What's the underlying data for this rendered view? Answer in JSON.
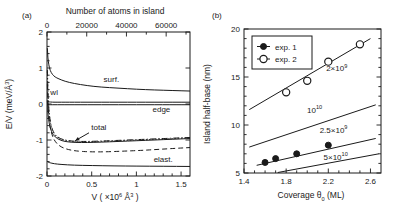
{
  "figure": {
    "panel_a_tag": "(a)",
    "panel_b_tag": "(b)"
  },
  "chart_data": [
    {
      "type": "line",
      "panel": "(a)",
      "title": "",
      "xlabel": "V ( ×10⁶ Å³ )",
      "xlabel_parts": {
        "base": "V ( ×10",
        "exp": "6",
        "unit": " Å",
        "unit_exp": "3",
        "close": " )"
      },
      "ylabel": "E/V (meV/Å³)",
      "ylabel_parts": {
        "base": "E/V (meV/Å",
        "exp": "3",
        "close": ")"
      },
      "top_axis_label": "Number of atoms in island",
      "xlim": [
        0,
        1.6
      ],
      "ylim": [
        -2,
        2
      ],
      "xticks": [
        0,
        0.5,
        1,
        1.5
      ],
      "xticklabels": [
        "0",
        "0.5",
        "1",
        "1.5"
      ],
      "yticks": [
        -2,
        -1,
        0,
        1,
        2
      ],
      "yticklabels": [
        "-2",
        "-1",
        "0",
        "1",
        "2"
      ],
      "top_ticks": [
        0,
        20000,
        40000,
        60000
      ],
      "top_ticklabels": [
        "0",
        "20000",
        "40000",
        "60000"
      ],
      "top_lim": [
        0,
        72000
      ],
      "grid": false,
      "legend": "inline-curve-labels",
      "annotations": [
        {
          "text": "surf.",
          "x": 0.72,
          "y": 0.62
        },
        {
          "text": "wl",
          "x": 0.08,
          "y": 0.25
        },
        {
          "text": "edge",
          "x": 1.28,
          "y": -0.22
        },
        {
          "text": "total",
          "x": 0.58,
          "y": -0.72
        },
        {
          "text": "elast.",
          "x": 1.3,
          "y": -1.62
        }
      ],
      "series": [
        {
          "name": "surf.",
          "style": "solid",
          "x": [
            0.004,
            0.01,
            0.02,
            0.035,
            0.06,
            0.09,
            0.13,
            0.2,
            0.3,
            0.45,
            0.6,
            0.8,
            1.0,
            1.2,
            1.4,
            1.6
          ],
          "y": [
            1.55,
            1.3,
            1.08,
            0.93,
            0.82,
            0.75,
            0.7,
            0.63,
            0.57,
            0.51,
            0.47,
            0.44,
            0.41,
            0.39,
            0.375,
            0.36
          ]
        },
        {
          "name": "wl",
          "style": "solid",
          "x": [
            0.004,
            0.02,
            0.06,
            0.12,
            0.2,
            0.3,
            0.45,
            0.6,
            0.8,
            1.0,
            1.2,
            1.4,
            1.6
          ],
          "y": [
            0.07,
            0.06,
            0.05,
            0.05,
            0.05,
            0.05,
            0.05,
            0.05,
            0.05,
            0.05,
            0.05,
            0.05,
            0.05
          ]
        },
        {
          "name": "edge",
          "style": "solid",
          "x": [
            0.004,
            0.03,
            0.1,
            0.3,
            0.6,
            1.0,
            1.4,
            1.6
          ],
          "y": [
            -0.02,
            -0.02,
            -0.02,
            -0.02,
            -0.02,
            -0.02,
            -0.02,
            -0.02
          ]
        },
        {
          "name": "total",
          "style": "solid",
          "x": [
            0.004,
            0.012,
            0.025,
            0.05,
            0.09,
            0.15,
            0.22,
            0.32,
            0.45,
            0.6,
            0.8,
            1.0,
            1.2,
            1.4,
            1.6
          ],
          "y": [
            0.1,
            -0.3,
            -0.56,
            -0.78,
            -0.92,
            -1.01,
            -1.05,
            -1.07,
            -1.07,
            -1.06,
            -1.04,
            -1.02,
            -1.0,
            -0.98,
            -0.96
          ]
        },
        {
          "name": "total-variant-dashdot",
          "style": "dashdot",
          "x": [
            0.004,
            0.012,
            0.025,
            0.05,
            0.09,
            0.15,
            0.22,
            0.32,
            0.45,
            0.6,
            0.8,
            1.0,
            1.2,
            1.4,
            1.6
          ],
          "y": [
            0.95,
            0.2,
            -0.3,
            -0.66,
            -0.86,
            -0.97,
            -1.01,
            -1.04,
            -1.04,
            -1.03,
            -1.01,
            -0.99,
            -0.97,
            -0.95,
            -0.93
          ]
        },
        {
          "name": "total-variant-dotted",
          "style": "dotted",
          "x": [
            0.004,
            0.012,
            0.025,
            0.05,
            0.09,
            0.15,
            0.22,
            0.32,
            0.45,
            0.6,
            0.8,
            1.0,
            1.2,
            1.4,
            1.6
          ],
          "y": [
            0.9,
            0.16,
            -0.33,
            -0.68,
            -0.88,
            -0.98,
            -1.02,
            -1.05,
            -1.05,
            -1.04,
            -1.02,
            -1.0,
            -0.98,
            -0.96,
            -0.94
          ]
        },
        {
          "name": "elast.-dashed",
          "style": "dashed",
          "x": [
            0.004,
            0.012,
            0.03,
            0.06,
            0.1,
            0.16,
            0.24,
            0.34,
            0.48,
            0.65,
            0.85,
            1.05,
            1.25,
            1.45,
            1.6
          ],
          "y": [
            0.55,
            -0.1,
            -0.6,
            -0.9,
            -1.08,
            -1.2,
            -1.27,
            -1.31,
            -1.33,
            -1.33,
            -1.31,
            -1.29,
            -1.26,
            -1.23,
            -1.21
          ]
        },
        {
          "name": "elast.",
          "style": "solid",
          "x": [
            0.004,
            0.03,
            0.08,
            0.16,
            0.3,
            0.5,
            0.75,
            1.0,
            1.3,
            1.6
          ],
          "y": [
            -1.6,
            -1.63,
            -1.66,
            -1.68,
            -1.7,
            -1.71,
            -1.72,
            -1.725,
            -1.73,
            -1.735
          ]
        }
      ]
    },
    {
      "type": "scatter",
      "panel": "(b)",
      "title": "",
      "xlabel": "Coverage θ₀ (ML)",
      "xlabel_parts": {
        "base": "Coverage ",
        "sym": "θ",
        "sub": "0",
        "unit": " (ML)"
      },
      "ylabel": "Island half-base (nm)",
      "xlim": [
        1.4,
        2.7
      ],
      "ylim": [
        5,
        20
      ],
      "xticks": [
        1.4,
        1.8,
        2.2,
        2.6
      ],
      "xticklabels": [
        "1.4",
        "1.8",
        "2.2",
        "2.6"
      ],
      "yticks": [
        5,
        10,
        15,
        20
      ],
      "yticklabels": [
        "5",
        "10",
        "15",
        "20"
      ],
      "grid": false,
      "legend_position": "upper-left",
      "legend": [
        {
          "label": "exp. 1",
          "marker": "filled-circle"
        },
        {
          "label": "exp. 2",
          "marker": "open-circle"
        }
      ],
      "series": [
        {
          "name": "exp. 1",
          "style": "filled-circle",
          "x": [
            1.6,
            1.7,
            1.9,
            2.2
          ],
          "y": [
            6.1,
            6.5,
            7.0,
            7.9
          ]
        },
        {
          "name": "exp. 2",
          "style": "open-circle",
          "x": [
            1.8,
            2.0,
            2.2,
            2.5
          ],
          "y": [
            13.4,
            14.6,
            16.6,
            18.4
          ]
        }
      ],
      "model_lines": [
        {
          "label": "2×10⁹",
          "label_base": "2×10",
          "label_exp": "9",
          "x": [
            1.45,
            2.6
          ],
          "y": [
            11.6,
            19.0
          ],
          "label_x": 2.28,
          "label_y": 15.6
        },
        {
          "label": "10¹⁰",
          "label_base": "10",
          "label_exp": "10",
          "x": [
            1.45,
            2.65
          ],
          "y": [
            7.7,
            12.1
          ],
          "label_x": 2.07,
          "label_y": 11.3
        },
        {
          "label": "2.5×10⁹",
          "label_base": "2.5×10",
          "label_exp": "9",
          "x": [
            1.52,
            2.65
          ],
          "y": [
            5.8,
            8.6
          ],
          "label_x": 2.25,
          "label_y": 9.2
        },
        {
          "label": "5×10¹⁰",
          "label_base": "5×10",
          "label_exp": "10",
          "x": [
            1.72,
            2.68
          ],
          "y": [
            5.05,
            7.0
          ],
          "label_x": 2.27,
          "label_y": 6.4
        }
      ]
    }
  ]
}
